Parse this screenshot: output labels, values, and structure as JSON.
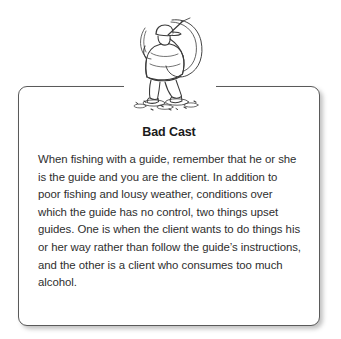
{
  "page": {
    "background_color": "#ffffff",
    "width": 341,
    "height": 339
  },
  "illustration": {
    "name": "fisherman-bad-cast-line-drawing",
    "alt": "Line drawing of a fisherman seen from behind wearing a cap, standing in shallow water with ripples, arms raised casting a fishing rod with a large tangled loop of line",
    "ink_color": "#3a3a3a"
  },
  "card": {
    "title": "Bad Cast",
    "border_color": "#5a5a5a",
    "background_color": "#ffffff",
    "text_color": "#2e2e2e",
    "body": "When fishing with a guide, remember that he or she is the guide and you are the client. In addition to poor fishing and lousy weather, conditions over which the guide has no control, two things upset guides. One is when the client wants to do things his or her way rather than follow the guide’s instructions, and the other is a client who consumes too much alcohol."
  }
}
